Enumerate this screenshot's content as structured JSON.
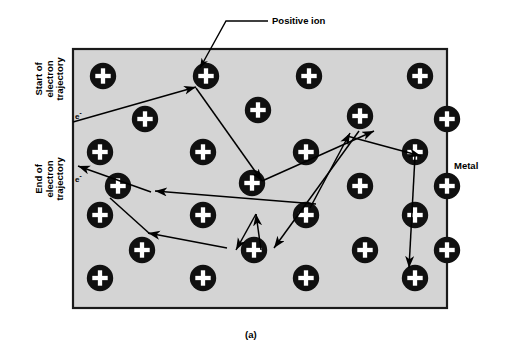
{
  "figure": {
    "caption": "(a)",
    "colors": {
      "metal_fill": "#d4d4d4",
      "metal_border": "#1a1a1a",
      "ion_fill": "#101010",
      "ion_plus": "#ffffff",
      "line": "#000000",
      "background": "#ffffff"
    },
    "metal_block": {
      "x": 73,
      "y": 49,
      "width": 374,
      "height": 259
    }
  },
  "labels": {
    "start_trajectory": "Start of\nelectron\ntrajectory",
    "end_trajectory": "End of\nelectron\ntrajectory",
    "positive_ion": "Positive ion",
    "metal": "Metal",
    "electron_start": "e",
    "electron_start_charge": "-",
    "electron_end": "e",
    "electron_end_charge": "-"
  },
  "ions": [
    {
      "cx": 103,
      "cy": 76
    },
    {
      "cx": 206,
      "cy": 76
    },
    {
      "cx": 309,
      "cy": 76
    },
    {
      "cx": 420,
      "cy": 76
    },
    {
      "cx": 145,
      "cy": 119
    },
    {
      "cx": 258,
      "cy": 110
    },
    {
      "cx": 360,
      "cy": 116
    },
    {
      "cx": 447,
      "cy": 119
    },
    {
      "cx": 100,
      "cy": 152
    },
    {
      "cx": 203,
      "cy": 152
    },
    {
      "cx": 306,
      "cy": 152
    },
    {
      "cx": 415,
      "cy": 152
    },
    {
      "cx": 118,
      "cy": 186
    },
    {
      "cx": 252,
      "cy": 183
    },
    {
      "cx": 360,
      "cy": 186
    },
    {
      "cx": 447,
      "cy": 186
    },
    {
      "cx": 100,
      "cy": 215
    },
    {
      "cx": 203,
      "cy": 215
    },
    {
      "cx": 306,
      "cy": 215
    },
    {
      "cx": 415,
      "cy": 215
    },
    {
      "cx": 142,
      "cy": 250
    },
    {
      "cx": 254,
      "cy": 250
    },
    {
      "cx": 365,
      "cy": 250
    },
    {
      "cx": 447,
      "cy": 250
    },
    {
      "cx": 100,
      "cy": 278
    },
    {
      "cx": 203,
      "cy": 278
    },
    {
      "cx": 306,
      "cy": 278
    },
    {
      "cx": 415,
      "cy": 278
    }
  ],
  "trajectory": {
    "description": "Electron scattering path through the metal lattice",
    "points": [
      {
        "x": 73,
        "y": 122
      },
      {
        "x": 192,
        "y": 88
      },
      {
        "x": 258,
        "y": 179
      },
      {
        "x": 370,
        "y": 132
      },
      {
        "x": 316,
        "y": 200
      },
      {
        "x": 151,
        "y": 189
      },
      {
        "x": 73,
        "y": 168
      }
    ],
    "segments_right": [
      {
        "x": 311,
        "y": 205
      },
      {
        "x": 358,
        "y": 134
      },
      {
        "x": 420,
        "y": 155
      },
      {
        "x": 408,
        "y": 266
      },
      {
        "x": 345,
        "y": 138
      },
      {
        "x": 273,
        "y": 245
      },
      {
        "x": 258,
        "y": 218
      },
      {
        "x": 231,
        "y": 250
      }
    ]
  },
  "leader_lines": {
    "positive_ion": [
      {
        "x": 268,
        "y": 21
      },
      {
        "x": 226,
        "y": 21
      },
      {
        "x": 199,
        "y": 66
      }
    ]
  }
}
